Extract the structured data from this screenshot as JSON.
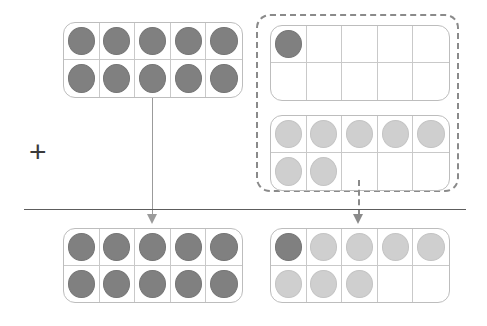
{
  "page": {
    "width": 487,
    "height": 326
  },
  "colors": {
    "dot_dark": "#808080",
    "dot_light": "#cfcfcf",
    "frame_border": "#bdbdbd",
    "grid_line": "#c9c9c9",
    "dashed_border": "#8a8a8a",
    "rule_line": "#5d5d5d",
    "arrow": "#9b9b9b",
    "plus_sign": "#3a3a3a",
    "background": "#ffffff"
  },
  "operator": {
    "symbol": "+",
    "name": "plus-sign"
  },
  "divider": {
    "name": "equals-bar",
    "style": "solid"
  },
  "arrows": [
    {
      "name": "arrow-left",
      "style": "solid",
      "from": "top-left-ten-frame",
      "to": "bottom-left-ten-frame"
    },
    {
      "name": "arrow-right",
      "style": "dashed",
      "from": "dashed-group",
      "to": "bottom-right-ten-frame"
    }
  ],
  "frames": [
    {
      "id": "top-left-ten-frame",
      "label": "Addend one ten-frame (full)",
      "filled_count": 10,
      "dark_count": 10,
      "light_count": 0,
      "cells": [
        "dark",
        "dark",
        "dark",
        "dark",
        "dark",
        "dark",
        "dark",
        "dark",
        "dark",
        "dark"
      ]
    },
    {
      "id": "group-top-ten-frame",
      "label": "Addend two, first ten-frame",
      "filled_count": 1,
      "dark_count": 1,
      "light_count": 0,
      "cells": [
        "dark",
        "empty",
        "empty",
        "empty",
        "empty",
        "empty",
        "empty",
        "empty",
        "empty",
        "empty"
      ]
    },
    {
      "id": "group-bottom-ten-frame",
      "label": "Addend two, second ten-frame",
      "filled_count": 7,
      "dark_count": 0,
      "light_count": 7,
      "cells": [
        "light",
        "light",
        "light",
        "light",
        "light",
        "light",
        "light",
        "empty",
        "empty",
        "empty"
      ]
    },
    {
      "id": "bottom-left-ten-frame",
      "label": "Sum ten-frame one (full)",
      "filled_count": 10,
      "dark_count": 10,
      "light_count": 0,
      "cells": [
        "dark",
        "dark",
        "dark",
        "dark",
        "dark",
        "dark",
        "dark",
        "dark",
        "dark",
        "dark"
      ]
    },
    {
      "id": "bottom-right-ten-frame",
      "label": "Sum ten-frame two",
      "filled_count": 8,
      "dark_count": 1,
      "light_count": 7,
      "cells": [
        "dark",
        "light",
        "light",
        "light",
        "light",
        "light",
        "light",
        "light",
        "empty",
        "empty"
      ]
    }
  ],
  "dashed_group": {
    "name": "dashed-group",
    "label": "Grouped addend two"
  }
}
